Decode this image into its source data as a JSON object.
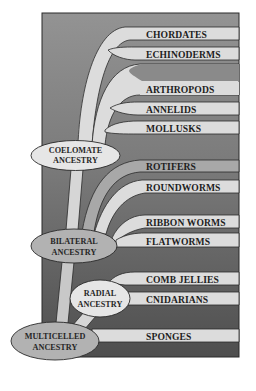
{
  "diagram": {
    "title": "",
    "type": "phylogenetic tree",
    "colors": {
      "background_top": "#909090",
      "background_bottom": "#505050",
      "branch_light": "#dcdcdc",
      "branch_mid": "#a8a8a8",
      "node_light": "#e6e6e6",
      "node_mid": "#b2b2b2",
      "outline": "#2a2a2a"
    },
    "groups": [
      {
        "label": "CHORDATES"
      },
      {
        "label": "ECHINODERMS"
      },
      {
        "label": "ARTHROPODS"
      },
      {
        "label": "ANNELIDS"
      },
      {
        "label": "MOLLUSKS"
      },
      {
        "label": "ROTIFERS"
      },
      {
        "label": "ROUNDWORMS"
      },
      {
        "label": "RIBBON WORMS"
      },
      {
        "label": "FLATWORMS"
      },
      {
        "label": "COMB JELLIES"
      },
      {
        "label": "CNIDARIANS"
      },
      {
        "label": "SPONGES"
      }
    ],
    "nodes": {
      "coelomate": {
        "line1": "COELOMATE",
        "line2": "ANCESTRY"
      },
      "bilateral": {
        "line1": "BILATERAL",
        "line2": "ANCESTRY"
      },
      "radial": {
        "line1": "RADIAL",
        "line2": "ANCESTRY"
      },
      "multicelled": {
        "line1": "MULTICELLED",
        "line2": "ANCESTRY"
      }
    }
  }
}
